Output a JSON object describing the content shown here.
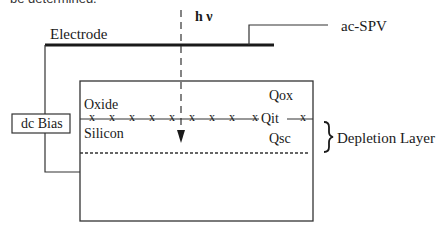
{
  "caption_fragment": "be determined.",
  "diagram": {
    "labels": {
      "electrode": "Electrode",
      "light": "h ν",
      "ac_spv": "ac-SPV",
      "dc_bias": "dc Bias",
      "oxide": "Oxide",
      "silicon": "Silicon",
      "qox": "Qox",
      "qit": "Qit",
      "qsc": "Qsc",
      "depletion_layer": "Depletion Layer"
    },
    "interface_marks": [
      "x",
      "x",
      "x",
      "x",
      "x",
      "x",
      "x",
      "x",
      "x",
      "x"
    ],
    "colors": {
      "line": "#1a1a1a",
      "background": "#ffffff"
    }
  }
}
